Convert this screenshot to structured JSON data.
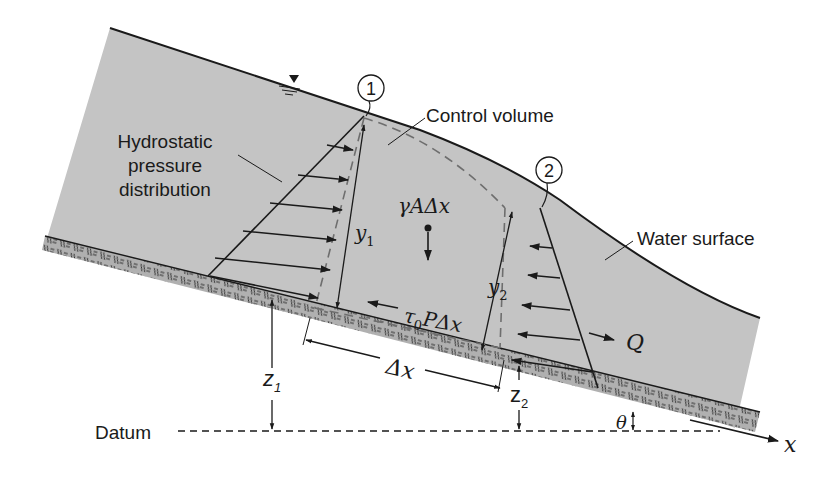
{
  "figure": {
    "colors": {
      "water": "#c4c4c4",
      "bed": "#a9a9a9",
      "line": "#1a1a1a",
      "dashed_cv": "#6e6e6e",
      "background": "#ffffff"
    }
  },
  "labels": {
    "section_1": "1",
    "section_2": "2",
    "control_volume": "Control volume",
    "hydrostatic_line1": "Hydrostatic",
    "hydrostatic_line2": "pressure",
    "hydrostatic_line3": "distribution",
    "water_surface": "Water surface",
    "weight": "γAΔx",
    "shear_tau": "τ",
    "shear_sub": "0",
    "shear_rest": "PΔx",
    "y1": "y",
    "y1_sub": "1",
    "y2": "y",
    "y2_sub": "2",
    "z1": "z",
    "z1_sub": "1",
    "z2": "z",
    "z2_sub": "2",
    "dx": "Δx",
    "flow": "Q",
    "datum": "Datum",
    "theta": "θ",
    "x_axis": "x"
  }
}
